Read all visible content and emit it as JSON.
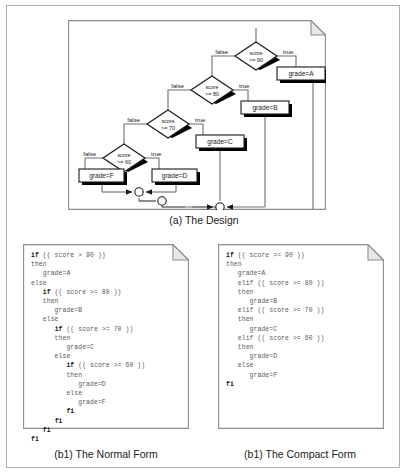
{
  "figure": {
    "caption_a": "(a) The Design",
    "caption_b1": "(b1) The Normal Form",
    "caption_b2": "(b1) The Compact Form"
  },
  "diagram": {
    "type": "flowchart",
    "decisions": [
      {
        "id": "d90",
        "text_line1": "score",
        "text_line2": ">= 90",
        "false_label": "false",
        "true_label": "true"
      },
      {
        "id": "d80",
        "text_line1": "score",
        "text_line2": ">= 80",
        "false_label": "false",
        "true_label": "true"
      },
      {
        "id": "d70",
        "text_line1": "score",
        "text_line2": ">= 70",
        "false_label": "false",
        "true_label": "true"
      },
      {
        "id": "d60",
        "text_line1": "score",
        "text_line2": ">= 60",
        "false_label": "false",
        "true_label": "true"
      }
    ],
    "actions": [
      {
        "id": "aA",
        "label": "grade=A"
      },
      {
        "id": "aB",
        "label": "grade=B"
      },
      {
        "id": "aC",
        "label": "grade=C"
      },
      {
        "id": "aD",
        "label": "grade=D"
      },
      {
        "id": "aF",
        "label": "grade=F"
      }
    ],
    "merge_nodes": 4,
    "colors": {
      "line": "#6e6e6e",
      "shape_stroke": "#1a1a1a",
      "shadow": "#000000",
      "page_border": "#8c8c8c"
    }
  },
  "code": {
    "normal_form": "if (( score > 90 ))\nthen\n   grade=A\nelse\n   if (( score >= 80 ))\n   then\n      grade=B\n   else\n      if (( score >= 70 ))\n      then\n         grade=C\n      else\n         if (( score >= 60 ))\n         then\n            grade=D\n         else\n            grade=F\n         fi\n      fi\n   fi\nfi",
    "compact_form": "if (( score >= 90 ))\nthen\n   grade=A\n   elif (( score >= 80 ))\n   then\n      grade=B\n   elif (( score >= 70 ))\n   then\n      grade=C\n   elif (( score >= 60 ))\n   then\n      grade=D\n   else\n      grade=F\nfi"
  }
}
